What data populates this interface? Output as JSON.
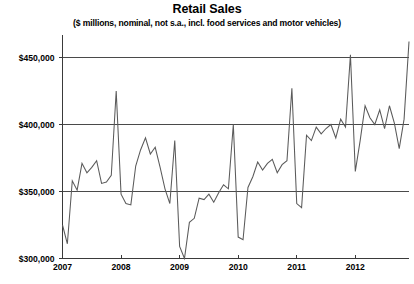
{
  "chart_data": {
    "type": "line",
    "title": "Retail Sales",
    "subtitle": "($ millions, nominal, not s.a., incl. food services and  motor vehicles)",
    "xlabel": "",
    "ylabel": "",
    "grid": true,
    "legend": "none",
    "xlim": [
      2007.0,
      2012.917
    ],
    "ylim": [
      300000,
      462000
    ],
    "y_ticks": [
      300000,
      350000,
      400000,
      450000
    ],
    "y_tick_labels": [
      "$300,000",
      "$350,000",
      "$400,000",
      "$450,000"
    ],
    "x_ticks": [
      2007,
      2008,
      2009,
      2010,
      2011,
      2012
    ],
    "x_tick_labels": [
      "2007",
      "2008",
      "2009",
      "2010",
      "2011",
      "2012"
    ],
    "line_color": "#5a5a5a",
    "series": [
      {
        "name": "Retail Sales",
        "x": [
          2007.0,
          2007.083,
          2007.167,
          2007.25,
          2007.333,
          2007.417,
          2007.5,
          2007.583,
          2007.667,
          2007.75,
          2007.833,
          2007.917,
          2008.0,
          2008.083,
          2008.167,
          2008.25,
          2008.333,
          2008.417,
          2008.5,
          2008.583,
          2008.667,
          2008.75,
          2008.833,
          2008.917,
          2009.0,
          2009.083,
          2009.167,
          2009.25,
          2009.333,
          2009.417,
          2009.5,
          2009.583,
          2009.667,
          2009.75,
          2009.833,
          2009.917,
          2010.0,
          2010.083,
          2010.167,
          2010.25,
          2010.333,
          2010.417,
          2010.5,
          2010.583,
          2010.667,
          2010.75,
          2010.833,
          2010.917,
          2011.0,
          2011.083,
          2011.167,
          2011.25,
          2011.333,
          2011.417,
          2011.5,
          2011.583,
          2011.667,
          2011.75,
          2011.833,
          2011.917,
          2012.0,
          2012.083,
          2012.167,
          2012.25,
          2012.333,
          2012.417,
          2012.5,
          2012.583,
          2012.667,
          2012.75,
          2012.833,
          2012.917
        ],
        "values": [
          325000,
          311000,
          358000,
          351000,
          371000,
          364000,
          368000,
          373000,
          356000,
          357000,
          362000,
          425000,
          348000,
          341000,
          340000,
          369000,
          381000,
          390000,
          378000,
          383000,
          368000,
          352000,
          341000,
          388000,
          309000,
          300000,
          327000,
          330000,
          345000,
          344000,
          348000,
          342000,
          349000,
          355000,
          352000,
          400000,
          316000,
          314000,
          353000,
          361000,
          372000,
          366000,
          371000,
          374000,
          364000,
          370000,
          373000,
          427000,
          341000,
          338000,
          392000,
          388000,
          398000,
          393000,
          397000,
          400000,
          390000,
          404000,
          398000,
          452000,
          365000,
          388000,
          414000,
          405000,
          400000,
          411000,
          397000,
          414000,
          401000,
          382000,
          404000,
          462000
        ]
      }
    ]
  }
}
